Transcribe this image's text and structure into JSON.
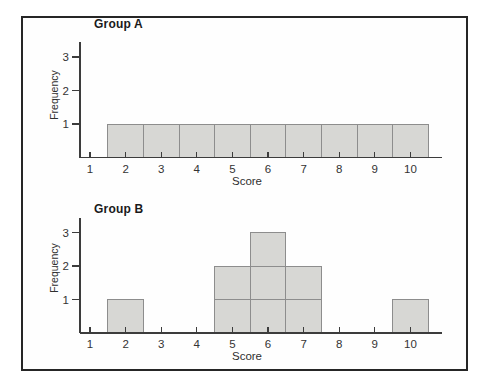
{
  "colors": {
    "background": "#ffffff",
    "frame": "#262626",
    "bar_fill": "#d7d7d4",
    "bar_stroke": "#8d8d8d",
    "axis": "#3c3c3c",
    "tick_text": "#333333",
    "title_text": "#1a1a1a"
  },
  "chart_data": [
    {
      "type": "bar",
      "chart_style": "histogram-unit-squares",
      "title": "Group A",
      "xlabel": "Score",
      "ylabel": "Frequency",
      "categories": [
        1,
        2,
        3,
        4,
        5,
        6,
        7,
        8,
        9,
        10
      ],
      "values": [
        0,
        1,
        1,
        1,
        1,
        1,
        1,
        1,
        1,
        1
      ],
      "x_tick_labels": [
        "1",
        "2",
        "3",
        "4",
        "5",
        "6",
        "7",
        "8",
        "9",
        "10"
      ],
      "y_ticks": [
        1,
        2,
        3
      ],
      "y_tick_labels": [
        "1",
        "2",
        "3"
      ],
      "ylim": [
        0,
        3.5
      ],
      "bar_width": 1,
      "grid": false,
      "legend": false
    },
    {
      "type": "bar",
      "chart_style": "histogram-unit-squares",
      "title": "Group B",
      "xlabel": "Score",
      "ylabel": "Frequency",
      "categories": [
        1,
        2,
        3,
        4,
        5,
        6,
        7,
        8,
        9,
        10
      ],
      "values": [
        0,
        1,
        0,
        0,
        2,
        3,
        2,
        0,
        0,
        1
      ],
      "x_tick_labels": [
        "1",
        "2",
        "3",
        "4",
        "5",
        "6",
        "7",
        "8",
        "9",
        "10"
      ],
      "y_ticks": [
        1,
        2,
        3
      ],
      "y_tick_labels": [
        "1",
        "2",
        "3"
      ],
      "ylim": [
        0,
        3.5
      ],
      "bar_width": 1,
      "grid": false,
      "legend": false
    }
  ]
}
